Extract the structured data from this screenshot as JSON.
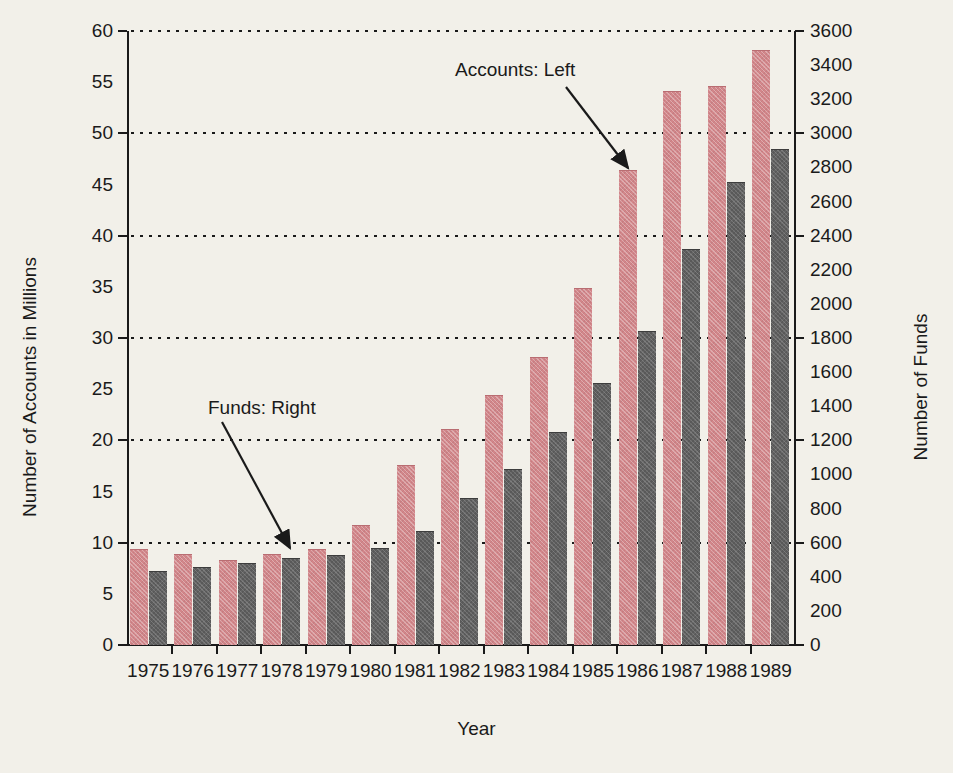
{
  "chart_data": {
    "type": "bar",
    "title": "",
    "subtitle": "",
    "xlabel": "Year",
    "ylabel": "Number of Accounts in Millions",
    "ylabel_right": "Number of Funds",
    "grid": true,
    "legend_position": "inline-annotations",
    "categories": [
      "1975",
      "1976",
      "1977",
      "1978",
      "1979",
      "1980",
      "1981",
      "1982",
      "1983",
      "1984",
      "1985",
      "1986",
      "1987",
      "1988",
      "1989"
    ],
    "ylim": [
      0,
      60
    ],
    "ylim_right": [
      0,
      3600
    ],
    "yticks": [
      0,
      5,
      10,
      15,
      20,
      25,
      30,
      35,
      40,
      45,
      50,
      55,
      60
    ],
    "yticks_right": [
      0,
      200,
      400,
      600,
      800,
      1000,
      1200,
      1400,
      1600,
      1800,
      2000,
      2200,
      2400,
      2600,
      2800,
      3000,
      3200,
      3400,
      3600
    ],
    "gridline_values": [
      10,
      20,
      30,
      40,
      50,
      60
    ],
    "series": [
      {
        "name": "Accounts: Left",
        "axis": "left",
        "unit": "millions",
        "color": "#d2868a",
        "values": [
          9.3,
          8.8,
          8.2,
          8.8,
          9.3,
          11.6,
          17.5,
          21.0,
          24.3,
          28.0,
          34.8,
          46.3,
          54.0,
          54.5,
          58.0
        ]
      },
      {
        "name": "Funds: Right",
        "axis": "right",
        "unit": "funds",
        "color": "#595959",
        "values": [
          426,
          452,
          477,
          505,
          524,
          564,
          665,
          857,
          1026,
          1243,
          1528,
          1835,
          2317,
          2710,
          2900
        ]
      }
    ],
    "annotations": [
      {
        "label": "Accounts: Left",
        "target_series": "Accounts: Left",
        "target_category": "1986"
      },
      {
        "label": "Funds: Right",
        "target_series": "Funds: Right",
        "target_category": "1978"
      }
    ]
  },
  "colors": {
    "background": "#f2f0e9",
    "accounts_bar": "#d2868a",
    "funds_bar": "#595959",
    "axis": "#1a1a1a"
  }
}
